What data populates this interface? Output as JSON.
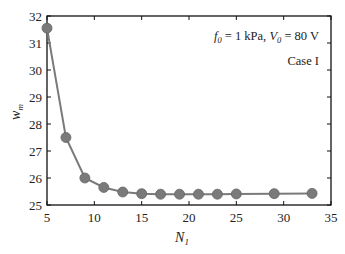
{
  "chart_data": {
    "type": "line",
    "title": "",
    "xlabel": "N_1",
    "ylabel": "w_m",
    "xlim": [
      5,
      35
    ],
    "ylim": [
      25,
      32
    ],
    "xticks": [
      5,
      10,
      15,
      20,
      25,
      30,
      35
    ],
    "yticks": [
      25,
      26,
      27,
      28,
      29,
      30,
      31,
      32
    ],
    "grid": false,
    "legend": null,
    "annotations": [
      "f_0 = 1 kPa, V_0 = 80 V",
      "Case I"
    ],
    "series": [
      {
        "name": "w_m",
        "color": "#7a7a7a",
        "marker": "circle",
        "x": [
          5,
          7,
          9,
          11,
          13,
          15,
          17,
          19,
          21,
          23,
          25,
          29,
          33
        ],
        "y": [
          31.55,
          27.5,
          26.0,
          25.65,
          25.48,
          25.42,
          25.4,
          25.4,
          25.4,
          25.4,
          25.41,
          25.42,
          25.43
        ]
      }
    ]
  },
  "labels": {
    "xlabel_main": "N",
    "xlabel_sub": "1",
    "ylabel_main": "w",
    "ylabel_sub": "m",
    "annot_f": "f",
    "annot_f_sub": "0",
    "annot_mid": " = 1 kPa, ",
    "annot_v": "V",
    "annot_v_sub": "0",
    "annot_end": " = 80 V",
    "case": "Case I"
  }
}
